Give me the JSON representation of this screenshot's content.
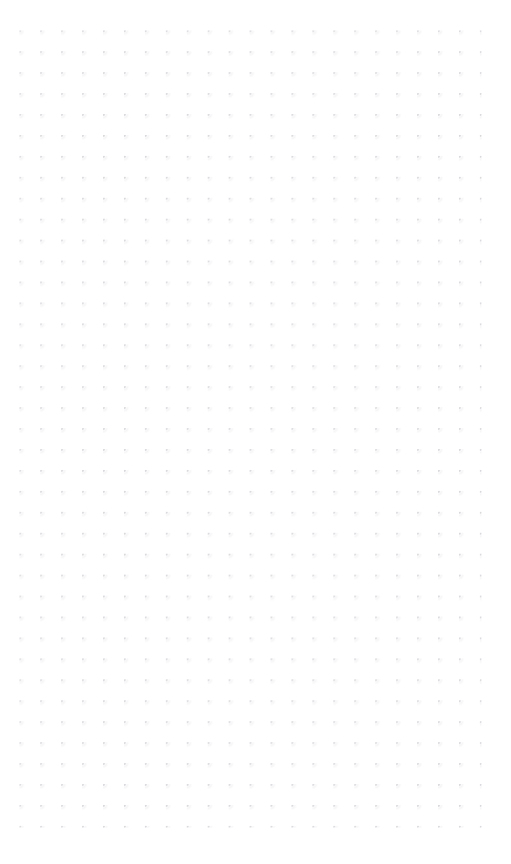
{
  "page": {
    "width": 511,
    "height": 864,
    "background_color": "#ffffff",
    "surface_type": "dotted-paper",
    "text_content": "",
    "note": ""
  },
  "dot_grid": {
    "name": "dot-grid",
    "dot_color": "#d8d8dc",
    "halo_color": "#f4f4f6",
    "background_color": "#ffffff",
    "dot_size_px": 1.4,
    "spacing_x_px": 20.95,
    "spacing_y_px": 20.95,
    "origin_x_px": 20,
    "origin_y_px": 31,
    "columns": 23,
    "rows": 39,
    "margin_top_px": 26,
    "margin_left_px": 20,
    "margin_right_px": 28,
    "margin_bottom_px": 34
  }
}
